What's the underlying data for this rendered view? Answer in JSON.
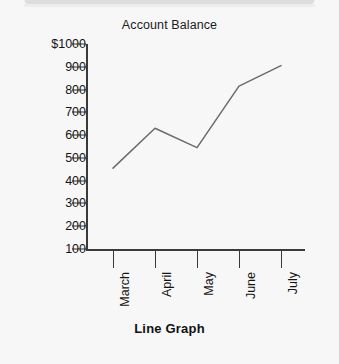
{
  "chart_title": "Account Balance",
  "caption": "Line Graph",
  "colors": {
    "background": "#f7f7f7",
    "axis": "#3a3a3a",
    "line": "#6b6b6b",
    "text": "#141414",
    "top_bar": "#d8d8d8"
  },
  "chart_data": {
    "type": "line",
    "title": "Account Balance",
    "xlabel": "",
    "ylabel": "",
    "categories": [
      "March",
      "April",
      "May",
      "June",
      "July"
    ],
    "values": [
      455,
      630,
      545,
      815,
      905
    ],
    "series": [
      {
        "name": "Account Balance",
        "values": [
          455,
          630,
          545,
          815,
          905
        ]
      }
    ],
    "ylim": [
      100,
      1000
    ],
    "ytick_labels": [
      "100",
      "200",
      "300",
      "400",
      "500",
      "600",
      "700",
      "800",
      "900",
      "$1000"
    ],
    "ytick_values": [
      100,
      200,
      300,
      400,
      500,
      600,
      700,
      800,
      900,
      1000
    ],
    "grid": false,
    "legend": "none",
    "xtick_label_rotation": "90",
    "currency_symbol": "$"
  }
}
